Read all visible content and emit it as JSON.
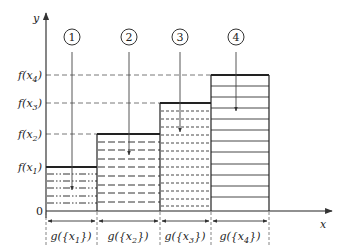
{
  "diagram": {
    "type": "lebesgue-integral-step-function",
    "axes": {
      "x_label": "x",
      "y_label": "y",
      "origin_label": "0"
    },
    "levels": [
      {
        "id": "x1",
        "label": "f(x",
        "sub": "1",
        "close": ")"
      },
      {
        "id": "x2",
        "label": "f(x",
        "sub": "2",
        "close": ")"
      },
      {
        "id": "x3",
        "label": "f(x",
        "sub": "3",
        "close": ")"
      },
      {
        "id": "x4",
        "label": "f(x",
        "sub": "4",
        "close": ")"
      }
    ],
    "bars": [
      {
        "marker": "1",
        "hatch": "dash-dot-dot",
        "measure_label": "g({x",
        "measure_sub": "1",
        "measure_close": "})"
      },
      {
        "marker": "2",
        "hatch": "long-dash",
        "measure_label": "g({x",
        "measure_sub": "2",
        "measure_close": "})"
      },
      {
        "marker": "3",
        "hatch": "short-dash",
        "measure_label": "g({x",
        "measure_sub": "3",
        "measure_close": "})"
      },
      {
        "marker": "4",
        "hatch": "solid",
        "measure_label": "g({x",
        "measure_sub": "4",
        "measure_close": "})"
      }
    ],
    "colors": {
      "line": "#333333",
      "guide": "#555555",
      "background": "#ffffff"
    }
  }
}
